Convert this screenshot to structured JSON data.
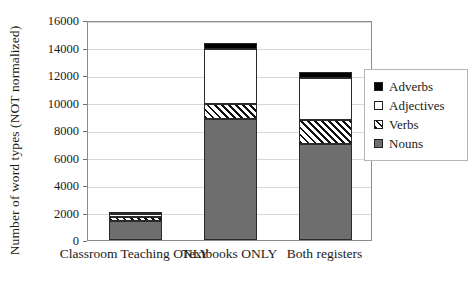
{
  "chart_data": {
    "type": "bar",
    "stacked": true,
    "title": "",
    "xlabel": "",
    "ylabel": "Number of word types (NOT normalized)",
    "ylim": [
      0,
      16000
    ],
    "ytick_labels": [
      "0",
      "2000",
      "4000",
      "6000",
      "8000",
      "10000",
      "12000",
      "14000",
      "16000"
    ],
    "ytick_values": [
      0,
      2000,
      4000,
      6000,
      8000,
      10000,
      12000,
      14000,
      16000
    ],
    "grid": true,
    "legend_position": "right",
    "categories": [
      "Classroom Teaching ONLY",
      "Textbooks ONLY",
      "Both registers"
    ],
    "series": [
      {
        "name": "Nouns",
        "color": "#6e6e6e",
        "pattern": "solid-gray",
        "values": [
          1400,
          8800,
          7000
        ]
      },
      {
        "name": "Verbs",
        "color": "#ffffff",
        "pattern": "diagonal-hatch",
        "values": [
          250,
          1100,
          1700
        ]
      },
      {
        "name": "Adjectives",
        "color": "#ffffff",
        "pattern": "solid-white",
        "values": [
          250,
          4000,
          3100
        ]
      },
      {
        "name": "Adverbs",
        "color": "#000000",
        "pattern": "solid-black",
        "values": [
          120,
          400,
          400
        ]
      }
    ],
    "totals": [
      2020,
      14300,
      12200
    ],
    "legend_order": [
      "Adverbs",
      "Adjectives",
      "Verbs",
      "Nouns"
    ]
  }
}
